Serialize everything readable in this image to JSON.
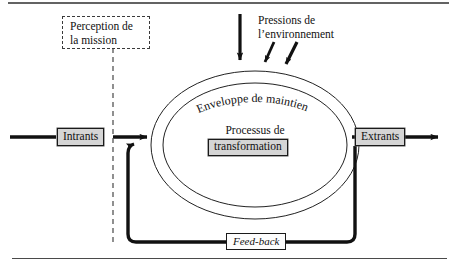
{
  "diagram": {
    "title_visible": false,
    "type": "systems-model-flow-diagram",
    "language": "fr"
  },
  "nodes": {
    "intrants": {
      "label": "Intrants",
      "style": "grey-box"
    },
    "extrants": {
      "label": "Extrants",
      "style": "grey-box"
    },
    "processus_line1": "Processus de",
    "processus_box": {
      "label": "transformation",
      "style": "grey-box"
    },
    "feedback": {
      "label": "Feed-back",
      "style": "white-box-italic"
    },
    "perception": {
      "line1": "Perception de",
      "line2": "la mission",
      "style": "dashed-box"
    },
    "pressions": {
      "line1": "Pressions de",
      "line2": "l’environnement",
      "style": "plain-text"
    },
    "enveloppe": {
      "label": "Enveloppe de maintien",
      "style": "curved-text-on-arc"
    }
  },
  "colors": {
    "ink": "#111111",
    "box_fill": "#d5d5d5",
    "box_border": "#1a1a1a",
    "white_fill": "#fdfdfd",
    "dashed_border": "#3a3a3a",
    "ellipse_stroke": "#202020",
    "rule": "#3a3a3a"
  },
  "connectors": [
    {
      "name": "input-arrow",
      "from": "left-edge",
      "to": "intrants",
      "weight": "thick",
      "arrowhead": true
    },
    {
      "name": "intrants-to-process",
      "from": "intrants",
      "to": "ellipse",
      "weight": "thick",
      "arrowhead": true
    },
    {
      "name": "process-to-extrants",
      "from": "ellipse",
      "to": "extrants",
      "weight": "thick",
      "arrowhead": false
    },
    {
      "name": "output-arrow",
      "from": "extrants",
      "to": "right-edge",
      "weight": "thick",
      "arrowhead": true
    },
    {
      "name": "feedback-loop",
      "from": "extrants",
      "to": "ellipse",
      "weight": "thick",
      "arrowhead": true
    },
    {
      "name": "pressure-arrow-1",
      "from": "top",
      "to": "ellipse",
      "weight": "thick",
      "arrowhead": true
    },
    {
      "name": "pressure-arrow-2",
      "from": "top-right",
      "to": "ellipse",
      "weight": "thick",
      "arrowhead": true
    },
    {
      "name": "pressure-arrow-3",
      "from": "top-right",
      "to": "ellipse",
      "weight": "thick",
      "arrowhead": true
    },
    {
      "name": "perception-dashed-line",
      "from": "perception",
      "to": "flow-axis",
      "weight": "dashed",
      "arrowhead": false
    }
  ],
  "rules": {
    "top_rule": true,
    "bottom_rule": true
  }
}
